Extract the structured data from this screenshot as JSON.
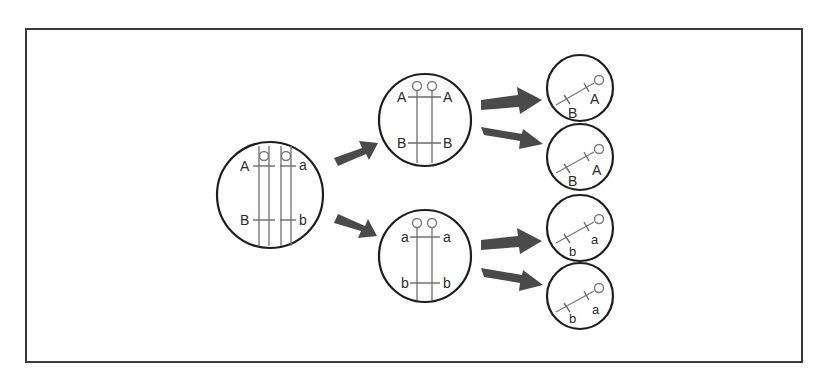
{
  "diagram": {
    "type": "meiosis-chromosome-segregation",
    "colors": {
      "frame": "#3a3a3a",
      "cell_outline": "#1e1e1e",
      "chromosome": "#7a7a7a",
      "arrow": "#4a4a4a",
      "background": "#ffffff"
    },
    "parent_cell": {
      "chromosomes": [
        {
          "upper_allele": "A",
          "lower_allele": "B"
        },
        {
          "upper_allele": "a",
          "lower_allele": "b"
        }
      ]
    },
    "intermediate_cells": [
      {
        "left_upper": "A",
        "right_upper": "A",
        "left_lower": "B",
        "right_lower": "B"
      },
      {
        "left_upper": "a",
        "right_upper": "a",
        "left_lower": "b",
        "right_lower": "b"
      }
    ],
    "gametes": [
      {
        "allele_1": "A",
        "allele_2": "B"
      },
      {
        "allele_1": "A",
        "allele_2": "B"
      },
      {
        "allele_1": "a",
        "allele_2": "b"
      },
      {
        "allele_1": "a",
        "allele_2": "b"
      }
    ]
  }
}
